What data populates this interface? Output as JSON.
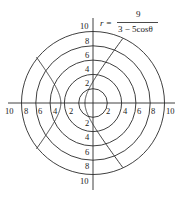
{
  "chart_data": {
    "type": "polar",
    "title": "",
    "equation": {
      "lhs": "r =",
      "numerator": "9",
      "denominator": "3 − 5cosθ"
    },
    "rings": [
      2,
      4,
      6,
      8,
      10
    ],
    "axes": {
      "horizontal_ticks_left": [
        "10",
        "8",
        "6",
        "4",
        "2"
      ],
      "horizontal_ticks_right": [
        "2",
        "4",
        "6",
        "8",
        "10"
      ],
      "vertical_ticks_top": [
        "10",
        "8",
        "6",
        "4",
        "2"
      ],
      "vertical_ticks_bottom": [
        "2",
        "4",
        "6",
        "8",
        "10"
      ]
    },
    "rlim": [
      0,
      10
    ],
    "grid": true,
    "curve": {
      "formula": "r = 9/(3 - 5cos(theta))",
      "kind": "hyperbola",
      "eccentricity": 1.6667,
      "vertices_xy": [
        [
          -1.125,
          0
        ],
        [
          -4.5,
          0
        ]
      ],
      "y_intercepts": [
        3,
        -3
      ],
      "asymptote_slopes": [
        1.3333,
        -1.3333
      ],
      "center_xy": [
        -2.8125,
        0
      ]
    }
  },
  "style": {
    "ink": "#2a2a2a",
    "background": "#ffffff"
  }
}
